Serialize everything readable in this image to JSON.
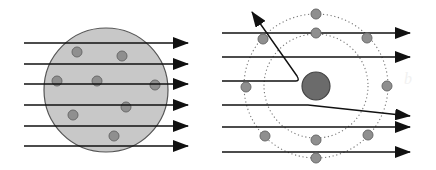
{
  "diagram": {
    "colors": {
      "background": "#ffffff",
      "line": "#111111",
      "pudding_fill": "#c8c8c8",
      "pudding_stroke": "#555555",
      "electron_fill": "#8f8f8f",
      "electron_stroke": "#6a6a6a",
      "nucleus_fill": "#6b6b6b",
      "nucleus_stroke": "#444444",
      "orbit_stroke": "#777777"
    },
    "thomson_model": {
      "sphere": {
        "cx": 106,
        "cy": 90,
        "r": 62
      },
      "electrons": [
        {
          "cx": 77,
          "cy": 52
        },
        {
          "cx": 122,
          "cy": 56
        },
        {
          "cx": 57,
          "cy": 81
        },
        {
          "cx": 97,
          "cy": 81
        },
        {
          "cx": 155,
          "cy": 85
        },
        {
          "cx": 126,
          "cy": 107
        },
        {
          "cx": 73,
          "cy": 115
        },
        {
          "cx": 114,
          "cy": 136
        }
      ],
      "rays": [
        {
          "y": 43
        },
        {
          "y": 64
        },
        {
          "y": 84
        },
        {
          "y": 105
        },
        {
          "y": 126
        },
        {
          "y": 146
        }
      ],
      "ray_start_x": 24,
      "ray_end_x": 188
    },
    "rutherford_model": {
      "nucleus": {
        "cx": 316,
        "cy": 86,
        "r": 14
      },
      "orbits": [
        {
          "r": 52
        },
        {
          "r": 72
        }
      ],
      "electrons": [
        {
          "cx": 316,
          "cy": 14
        },
        {
          "cx": 316,
          "cy": 33
        },
        {
          "cx": 263,
          "cy": 39
        },
        {
          "cx": 367,
          "cy": 38
        },
        {
          "cx": 246,
          "cy": 87
        },
        {
          "cx": 387,
          "cy": 86
        },
        {
          "cx": 265,
          "cy": 136
        },
        {
          "cx": 368,
          "cy": 135
        },
        {
          "cx": 316,
          "cy": 140
        },
        {
          "cx": 316,
          "cy": 158
        }
      ],
      "rays": [
        {
          "type": "straight",
          "y": 33
        },
        {
          "type": "straight",
          "y": 57
        },
        {
          "type": "backscatter",
          "y": 81,
          "turn_x": 300,
          "end_x": 252,
          "end_y": 12
        },
        {
          "type": "deflected",
          "y": 105,
          "bend_x": 308,
          "end_y": 116
        },
        {
          "type": "straight",
          "y": 127
        },
        {
          "type": "straight",
          "y": 152
        }
      ],
      "ray_start_x": 222,
      "ray_end_x": 410
    },
    "faint_label": "b"
  }
}
